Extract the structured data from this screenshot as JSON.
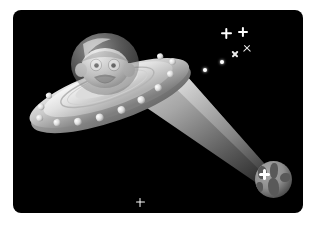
{
  "scene": {
    "title": "Cartoon flying saucer abducting Earth",
    "background_color": "#000000",
    "page_background": "#ffffff",
    "corner_radius_px": 8,
    "frame": {
      "x": 13,
      "y": 10,
      "width": 290,
      "height": 203
    }
  },
  "ufo": {
    "label": "flying saucer",
    "hull_color": "#d9d9d9",
    "hull_shadow_color": "#8c8c8c",
    "dome_color": "#bfbfbf",
    "rivet_color": "#e6e6e6",
    "rivet_count": 13,
    "alien": {
      "label": "alien pilot",
      "skin_color": "#d8d8d8",
      "eye_color": "#ffffff",
      "pupil_color": "#1a1a1a",
      "mouth_color": "#6b6b6b",
      "expression": "surprised"
    }
  },
  "beam": {
    "label": "tractor beam",
    "color_bright": "#d6d6d6",
    "color_dim": "#2e2e2e",
    "origin": {
      "x": 120,
      "y": 78
    },
    "target": {
      "x": 260,
      "y": 170
    }
  },
  "planet": {
    "label": "earth",
    "ocean_color": "#8e8e8e",
    "land_color": "#595959",
    "diameter_px": 37,
    "center": {
      "x": 260,
      "y": 170
    },
    "flash_color": "#ffffff"
  },
  "stars": [
    {
      "name": "star-bright-1",
      "x": 213,
      "y": 23,
      "size": 11,
      "shape": "four-point",
      "color": "#ffffff"
    },
    {
      "name": "star-bright-2",
      "x": 230,
      "y": 22,
      "size": 10,
      "shape": "four-point",
      "color": "#ffffff"
    },
    {
      "name": "star-cross-1",
      "x": 234,
      "y": 38,
      "size": 9,
      "shape": "x-cross",
      "color": "#e8e8e8"
    },
    {
      "name": "star-cross-2",
      "x": 222,
      "y": 44,
      "size": 8,
      "shape": "x-cross",
      "color": "#e8e8e8"
    },
    {
      "name": "star-dot-1",
      "x": 209,
      "y": 52,
      "size": 4,
      "shape": "dot",
      "color": "#ffffff"
    },
    {
      "name": "star-dot-2",
      "x": 192,
      "y": 60,
      "size": 4,
      "shape": "dot",
      "color": "#ffffff"
    },
    {
      "name": "star-bottom",
      "x": 127,
      "y": 192,
      "size": 9,
      "shape": "four-point",
      "color": "#ffffff"
    }
  ],
  "continents": [
    {
      "left": 3,
      "top": 5,
      "width": 9,
      "height": 13,
      "radius": "40% 60% 50% 45%"
    },
    {
      "left": 15,
      "top": 2,
      "width": 8,
      "height": 16,
      "radius": "50% 40% 60% 50%"
    },
    {
      "left": 13,
      "top": 17,
      "width": 11,
      "height": 18,
      "radius": "45% 55% 40% 60%"
    },
    {
      "left": 25,
      "top": 12,
      "width": 10,
      "height": 9,
      "radius": "60% 40% 50% 50%"
    },
    {
      "left": 1,
      "top": 21,
      "width": 7,
      "height": 10,
      "radius": "50% 50% 45% 55%"
    }
  ]
}
